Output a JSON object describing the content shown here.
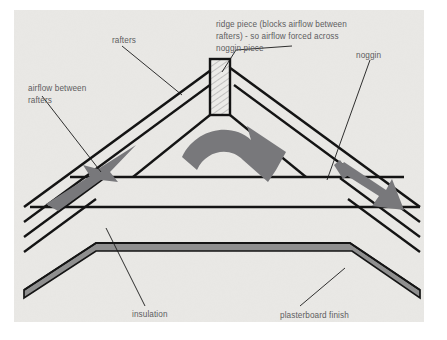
{
  "figure": {
    "type": "technical-cross-section-diagram",
    "canvas": {
      "width": 447,
      "height": 340,
      "outer_background": "#ffffff",
      "inner_background": "#e9e8e5",
      "inner_rect": {
        "x": 14,
        "y": 10,
        "width": 410,
        "height": 312
      }
    },
    "colors": {
      "line": "#141414",
      "arrow": "#78787b",
      "label_text": "#5d5d5f",
      "leader_line": "#1a1a1a",
      "board_fill": "#8f8f8f",
      "hatch": "#9a9a9a",
      "roof_fill": "#e9e8e5"
    }
  },
  "labels": {
    "rafters": {
      "text": "rafters",
      "x": 112,
      "y": 40
    },
    "ridge_piece": {
      "line1": "ridge piece (blocks airflow between",
      "line2": "rafters) - so airflow forced across",
      "line3": "noggin piece",
      "x": 216,
      "y": 24
    },
    "noggin": {
      "text": "noggin",
      "x": 356,
      "y": 55
    },
    "airflow_between_rafters": {
      "line1": "airflow between",
      "line2": "rafters",
      "x": 28,
      "y": 88
    },
    "insulation": {
      "text": "insulation",
      "x": 132,
      "y": 314
    },
    "plasterboard_finish": {
      "text": "plasterboard finish",
      "x": 280,
      "y": 315
    }
  },
  "annotations": {
    "arrows": [
      {
        "name": "airflow-arrow-left",
        "direction": "up-right",
        "meaning": "airflow entering between rafters at left eaves"
      },
      {
        "name": "airflow-arrow-center-curved",
        "direction": "arc-over-ridge-down-right",
        "meaning": "airflow forced across noggin piece over the ridge"
      },
      {
        "name": "airflow-arrow-right",
        "direction": "down-right",
        "meaning": "airflow exiting at right eaves"
      }
    ],
    "parts": [
      {
        "name": "ridge-piece",
        "hatched": true
      },
      {
        "name": "noggin"
      },
      {
        "name": "rafter-left"
      },
      {
        "name": "rafter-right"
      },
      {
        "name": "ceiling-joist"
      },
      {
        "name": "insulation-layer"
      },
      {
        "name": "plasterboard-layer"
      }
    ]
  }
}
